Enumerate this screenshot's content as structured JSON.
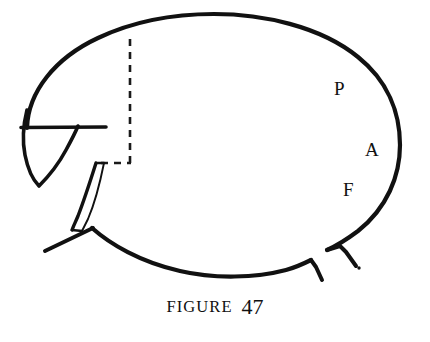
{
  "figure": {
    "caption_word": "FIGURE",
    "caption_number": "47",
    "background_color": "#ffffff",
    "ink_color": "#111111"
  },
  "annotations": [
    {
      "id": "P",
      "label": "P",
      "x": 340,
      "y": 90,
      "meaning": "posterior-marker"
    },
    {
      "id": "A",
      "label": "A",
      "x": 371,
      "y": 151,
      "meaning": "anterior-marker"
    },
    {
      "id": "F",
      "label": "F",
      "x": 349,
      "y": 191,
      "meaning": "fundus-marker"
    }
  ],
  "drawing": {
    "type": "line-diagram",
    "shapes": [
      {
        "name": "main-oval-outline",
        "kind": "ellipse-arc",
        "cx": 214,
        "cy": 145,
        "rx": 186,
        "ry": 122
      },
      {
        "name": "left-wedge-shape",
        "kind": "teardrop"
      },
      {
        "name": "wedge-crossbar-line",
        "kind": "line",
        "x1": 22,
        "y1": 128,
        "x2": 106,
        "y2": 127
      },
      {
        "name": "dashed-vertical-guide",
        "kind": "dashed-line",
        "x1": 130,
        "y1": 39,
        "x2": 130,
        "y2": 163
      },
      {
        "name": "dashed-horizontal-guide",
        "kind": "dashed-line",
        "x1": 103,
        "y1": 163,
        "x2": 130,
        "y2": 163
      },
      {
        "name": "curved-sliver-shape",
        "kind": "crescent"
      },
      {
        "name": "lower-left-straight-line",
        "kind": "line",
        "x1": 46,
        "y1": 250,
        "x2": 92,
        "y2": 228
      },
      {
        "name": "bottom-hook-left",
        "kind": "polyline"
      },
      {
        "name": "bottom-hook-right",
        "kind": "polyline"
      },
      {
        "name": "small-dot-mark",
        "kind": "dot",
        "cx": 358,
        "cy": 267,
        "r": 1.6
      }
    ]
  }
}
